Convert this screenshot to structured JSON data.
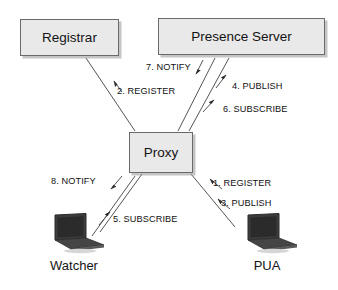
{
  "diagram": {
    "nodes": [
      {
        "id": "registrar",
        "label": "Registrar",
        "type": "box"
      },
      {
        "id": "presence-server",
        "label": "Presence Server",
        "type": "box"
      },
      {
        "id": "proxy",
        "label": "Proxy",
        "type": "box"
      },
      {
        "id": "watcher",
        "label": "Watcher",
        "type": "laptop"
      },
      {
        "id": "pua",
        "label": "PUA",
        "type": "laptop"
      }
    ],
    "messages": [
      {
        "step": 1,
        "label": "1. REGISTER",
        "from": "pua",
        "to": "proxy",
        "direction": "up-left"
      },
      {
        "step": 2,
        "label": "2. REGISTER",
        "from": "proxy",
        "to": "registrar",
        "direction": "up-left"
      },
      {
        "step": 3,
        "label": "3. PUBLISH",
        "from": "pua",
        "to": "proxy",
        "direction": "up-left"
      },
      {
        "step": 4,
        "label": "4. PUBLISH",
        "from": "proxy",
        "to": "presence-server",
        "direction": "up-right"
      },
      {
        "step": 5,
        "label": "5. SUBSCRIBE",
        "from": "watcher",
        "to": "proxy",
        "direction": "up-right"
      },
      {
        "step": 6,
        "label": "6. SUBSCRIBE",
        "from": "proxy",
        "to": "presence-server",
        "direction": "up-right"
      },
      {
        "step": 7,
        "label": "7. NOTIFY",
        "from": "presence-server",
        "to": "proxy",
        "direction": "down-left"
      },
      {
        "step": 8,
        "label": "8. NOTIFY",
        "from": "proxy",
        "to": "watcher",
        "direction": "down-left"
      }
    ],
    "colors": {
      "background": "#ffffff",
      "box_fill": "#e9e9e9",
      "box_border": "#6a6a6a",
      "box_shadow": "#969696",
      "line": "#555555",
      "text": "#131313",
      "laptop_body": "#3a3a3a",
      "laptop_screen": "#2b2b2b"
    }
  }
}
